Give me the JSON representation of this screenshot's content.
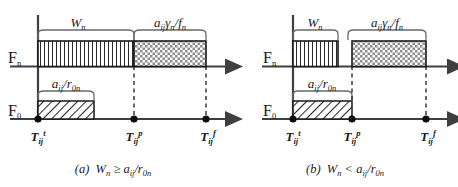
{
  "figure": {
    "type": "timeline-bar-diagram",
    "background_color": "#ffffff",
    "line_color": "#3f3f3f",
    "ink_color": "#1a1a1a"
  },
  "panels": [
    {
      "id": "panel-a",
      "caption_prefix": "(a)",
      "caption_body": "W",
      "caption_sub": "n",
      "caption_relation": "≥",
      "caption_num": "a",
      "caption_num_sub": "ij",
      "caption_slash": "/r",
      "caption_den_sub": "0n",
      "caption_full": "(a) Wn ≥ aij/r0n",
      "rows": [
        {
          "axis_name": "F",
          "axis_sub": "n",
          "axis_label_full": "Fn",
          "bars": [
            {
              "name": "work-bar",
              "pattern": "vertical-lines",
              "bracket_label_main": "W",
              "bracket_label_sub": "n",
              "bracket_label_full": "Wn"
            },
            {
              "name": "transfer-bar",
              "pattern": "checker",
              "bracket_label_full": "aijγn/fn",
              "bracket_num": "a",
              "bracket_num_sub": "ij",
              "bracket_gamma": "γ",
              "bracket_gamma_sub": "n",
              "bracket_den": "/f",
              "bracket_den_sub": "n"
            }
          ]
        },
        {
          "axis_name": "F",
          "axis_sub": "0",
          "axis_label_full": "F0",
          "bars": [
            {
              "name": "load-bar",
              "pattern": "diagonal-hatch",
              "bracket_label_full": "aij/r0n",
              "bracket_num": "a",
              "bracket_num_sub": "ij",
              "bracket_slash": "/r",
              "bracket_den_sub": "0n"
            }
          ]
        }
      ],
      "ticks": [
        {
          "name": "tick-start",
          "base": "T",
          "sub": "ij",
          "sup": "t",
          "full": "Tijt"
        },
        {
          "name": "tick-process",
          "base": "T",
          "sub": "ij",
          "sup": "p",
          "full": "Tijp"
        },
        {
          "name": "tick-finish",
          "base": "T",
          "sub": "ij",
          "sup": "f",
          "full": "Tijf"
        }
      ]
    },
    {
      "id": "panel-b",
      "caption_prefix": "(b)",
      "caption_body": "W",
      "caption_sub": "n",
      "caption_relation": "<",
      "caption_num": "a",
      "caption_num_sub": "ij",
      "caption_slash": "/r",
      "caption_den_sub": "0n",
      "caption_full": "(b) Wn < aij/r0n",
      "rows": [
        {
          "axis_name": "F",
          "axis_sub": "n",
          "axis_label_full": "Fn",
          "bars": [
            {
              "name": "work-bar",
              "pattern": "vertical-lines",
              "bracket_label_main": "W",
              "bracket_label_sub": "n",
              "bracket_label_full": "Wn"
            },
            {
              "name": "transfer-bar",
              "pattern": "checker",
              "bracket_label_full": "aijγn/fn",
              "bracket_num": "a",
              "bracket_num_sub": "ij",
              "bracket_gamma": "γ",
              "bracket_gamma_sub": "n",
              "bracket_den": "/f",
              "bracket_den_sub": "n"
            }
          ]
        },
        {
          "axis_name": "F",
          "axis_sub": "0",
          "axis_label_full": "F0",
          "bars": [
            {
              "name": "load-bar",
              "pattern": "diagonal-hatch",
              "bracket_label_full": "aij/r0n",
              "bracket_num": "a",
              "bracket_num_sub": "ij",
              "bracket_slash": "/r",
              "bracket_den_sub": "0n"
            }
          ]
        }
      ],
      "ticks": [
        {
          "name": "tick-start",
          "base": "T",
          "sub": "ij",
          "sup": "t",
          "full": "Tijt"
        },
        {
          "name": "tick-process",
          "base": "T",
          "sub": "ij",
          "sup": "p",
          "full": "Tijp"
        },
        {
          "name": "tick-finish",
          "base": "T",
          "sub": "ij",
          "sup": "f",
          "full": "Tijf"
        }
      ]
    }
  ]
}
